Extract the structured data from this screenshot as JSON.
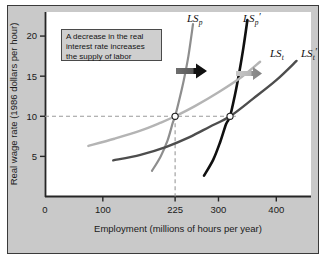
{
  "figure": {
    "panel_bg": "#c9c9c9",
    "plot_bg": "#ffffff",
    "border_color": "#3a3a3a"
  },
  "annotation": {
    "name": "annotation-callout",
    "line1": "A decrease in the real",
    "line2": "interest rate increases",
    "line3": "the supply of labor",
    "bg": "#cfcfcf",
    "border": "#4a4a4a"
  },
  "curve_labels": [
    {
      "base": "LS",
      "sub": "p",
      "prime": "",
      "x": 187,
      "y": 22,
      "name": "curve-label-lsp"
    },
    {
      "base": "LS",
      "sub": "p",
      "prime": "′",
      "x": 243,
      "y": 22,
      "name": "curve-label-lsp-prime"
    },
    {
      "base": "LS",
      "sub": "t",
      "prime": "",
      "x": 270,
      "y": 57,
      "name": "curve-label-lst"
    },
    {
      "base": "LS",
      "sub": "t",
      "prime": "′",
      "x": 301,
      "y": 57,
      "name": "curve-label-lst-prime"
    }
  ],
  "arrows": [
    {
      "name": "shift-arrow-dark",
      "label": "",
      "color_from": "#6e6e6e",
      "color_to": "#111111"
    },
    {
      "name": "shift-arrow-light",
      "label": "",
      "color_from": "#c2c2c2",
      "color_to": "#8a8a8a"
    }
  ],
  "chart_data": {
    "type": "line",
    "title": "",
    "xlabel": "Employment (millions of hours per year)",
    "ylabel": "Real wage rate (1986 dollars per hour)",
    "xlim": [
      0,
      460
    ],
    "ylim": [
      0,
      23
    ],
    "xticks": [
      0,
      100,
      225,
      300,
      400
    ],
    "xtick_labels": [
      "0",
      "100",
      "225",
      "300",
      "400"
    ],
    "yticks": [
      5,
      10,
      15,
      20
    ],
    "ytick_labels": [
      "5",
      "10",
      "15",
      "20"
    ],
    "grid": false,
    "legend": "inline-curve-labels",
    "series": [
      {
        "name": "LS_p",
        "label": "LSₚ",
        "color": "#8e8e8e",
        "width": 2.2,
        "description": "Original supply of labor, permanent income (steep)",
        "points": [
          [
            185,
            3.2
          ],
          [
            200,
            5.0
          ],
          [
            212,
            7.0
          ],
          [
            221,
            9.2
          ],
          [
            225,
            10.0
          ],
          [
            232,
            12.0
          ],
          [
            240,
            14.5
          ],
          [
            248,
            17.5
          ],
          [
            256,
            21.5
          ]
        ]
      },
      {
        "name": "LS_p_prime",
        "label": "LSₚ′",
        "color": "#101010",
        "width": 2.6,
        "description": "New supply of labor, permanent income (shifted right)",
        "points": [
          [
            275,
            2.6
          ],
          [
            291,
            4.6
          ],
          [
            303,
            6.8
          ],
          [
            313,
            9.0
          ],
          [
            320,
            10.0
          ],
          [
            328,
            12.5
          ],
          [
            336,
            15.5
          ],
          [
            343,
            18.5
          ],
          [
            350,
            22.0
          ]
        ]
      },
      {
        "name": "LS_t",
        "label": "LSₜ",
        "color": "#b4b4b4",
        "width": 2.4,
        "description": "Original supply of labor, temporary income (flat)",
        "points": [
          [
            75,
            6.3
          ],
          [
            120,
            7.2
          ],
          [
            165,
            8.2
          ],
          [
            200,
            9.2
          ],
          [
            225,
            10.0
          ],
          [
            260,
            11.3
          ],
          [
            300,
            13.0
          ],
          [
            340,
            14.9
          ],
          [
            372,
            16.8
          ]
        ]
      },
      {
        "name": "LS_t_prime",
        "label": "LSₜ′",
        "color": "#4d4d4d",
        "width": 2.4,
        "description": "New supply of labor, temporary income (shifted right)",
        "points": [
          [
            118,
            4.5
          ],
          [
            165,
            5.2
          ],
          [
            210,
            6.2
          ],
          [
            250,
            7.4
          ],
          [
            285,
            8.7
          ],
          [
            320,
            10.0
          ],
          [
            360,
            12.2
          ],
          [
            400,
            14.5
          ],
          [
            435,
            16.9
          ]
        ]
      }
    ],
    "equilibria": [
      {
        "name": "equilibrium-point-initial",
        "x": 225,
        "y": 10
      },
      {
        "name": "equilibrium-point-new",
        "x": 320,
        "y": 10
      }
    ],
    "reference_lines": [
      {
        "name": "dashed-wage-line",
        "orientation": "horizontal",
        "value": 10,
        "style": "dashed"
      },
      {
        "name": "dashed-employment-line",
        "orientation": "vertical",
        "value": 225,
        "style": "dashed"
      }
    ]
  }
}
